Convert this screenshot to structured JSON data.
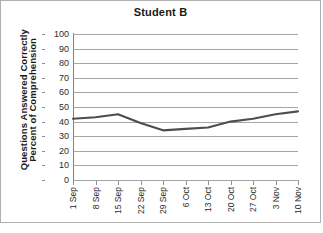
{
  "chart_data": {
    "type": "line",
    "title": "Student B",
    "xlabel": "",
    "ylabel": "Percent of Comprehension Questions Answered Correctly",
    "ylabel_line1": "Percent of Comprehension",
    "ylabel_line2": "Questions Answered Correctly",
    "categories": [
      "1 Sep",
      "8 Sep",
      "15 Sep",
      "22 Sep",
      "29 Sep",
      "6 Oct",
      "13 Oct",
      "20 Oct",
      "27 Oct",
      "3 Nov",
      "10 Nov"
    ],
    "values": [
      42,
      43,
      45,
      39,
      34,
      35,
      36,
      40,
      42,
      45,
      47
    ],
    "series": [
      {
        "name": "Student B",
        "values": [
          42,
          43,
          45,
          39,
          34,
          35,
          36,
          40,
          42,
          45,
          47
        ],
        "color": "#4d4d4d"
      }
    ],
    "ylim": [
      0,
      100
    ],
    "ytick_values": [
      0,
      10,
      20,
      30,
      40,
      50,
      60,
      70,
      80,
      90,
      100
    ],
    "ytick_labels": [
      "0",
      "10",
      "20",
      "30",
      "40",
      "50",
      "60",
      "70",
      "80",
      "90",
      "100"
    ],
    "grid": true,
    "legend": false,
    "legend_position": "none",
    "line_color": "#4d4d4d",
    "gridline_color": "#a6a6a6",
    "background_color": "#ffffff",
    "border_color": "#b0b0b0"
  }
}
